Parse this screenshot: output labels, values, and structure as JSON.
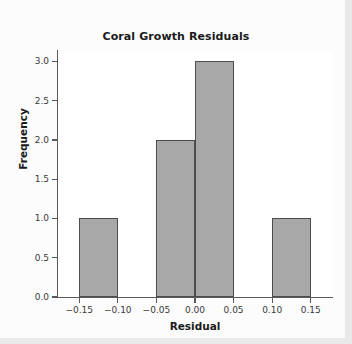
{
  "chart_data": {
    "type": "bar",
    "title": "Coral Growth Residuals",
    "xlabel": "Residual",
    "ylabel": "Frequency",
    "bin_edges": [
      -0.15,
      -0.1,
      -0.05,
      0.0,
      0.05,
      0.1,
      0.15
    ],
    "bin_width": 0.05,
    "categories": [
      "-0.15 to -0.10",
      "-0.10 to -0.05",
      "-0.05 to 0.00",
      "0.00 to 0.05",
      "0.05 to 0.10",
      "0.10 to 0.15"
    ],
    "values": [
      1,
      0,
      2,
      3,
      0,
      1
    ],
    "bars": [
      {
        "x0": -0.15,
        "x1": -0.1,
        "value": 1
      },
      {
        "x0": -0.05,
        "x1": 0.0,
        "value": 2
      },
      {
        "x0": 0.0,
        "x1": 0.05,
        "value": 3
      },
      {
        "x0": 0.1,
        "x1": 0.15,
        "value": 1
      }
    ],
    "xlim": [
      -0.1775,
      0.1775
    ],
    "ylim": [
      0,
      3.12
    ],
    "xticks": [
      -0.15,
      -0.1,
      -0.05,
      0.0,
      0.05,
      0.1,
      0.15
    ],
    "xtick_labels": [
      "−0.15",
      "−0.10",
      "−0.05",
      "0.00",
      "0.05",
      "0.10",
      "0.15"
    ],
    "yticks": [
      0.0,
      0.5,
      1.0,
      1.5,
      2.0,
      2.5,
      3.0
    ],
    "ytick_labels": [
      "0.0",
      "0.5",
      "1.0",
      "1.5",
      "2.0",
      "2.5",
      "3.0"
    ],
    "grid": false,
    "legend": false,
    "colors": {
      "bar_fill": "#a8a8a8",
      "bar_edge": "#4d4d4d",
      "axis": "#5a5a5a",
      "text": "#1a1a1a",
      "tick_text": "#3a3a3a",
      "figure_background": "#fcfcfc",
      "plot_background": "#ffffff"
    }
  }
}
